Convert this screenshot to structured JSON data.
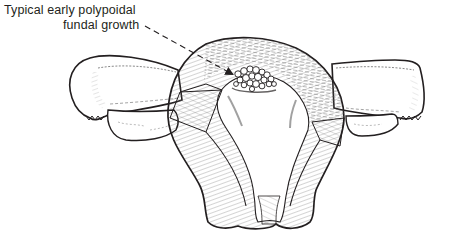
{
  "figure": {
    "annotation": {
      "line1": "Typical early polypoidal",
      "line2": "fundal growth",
      "pointer": "dashed-arrow"
    },
    "colors": {
      "ink": "#231f20",
      "background": "#ffffff",
      "shade": "#bdbdbd"
    }
  }
}
